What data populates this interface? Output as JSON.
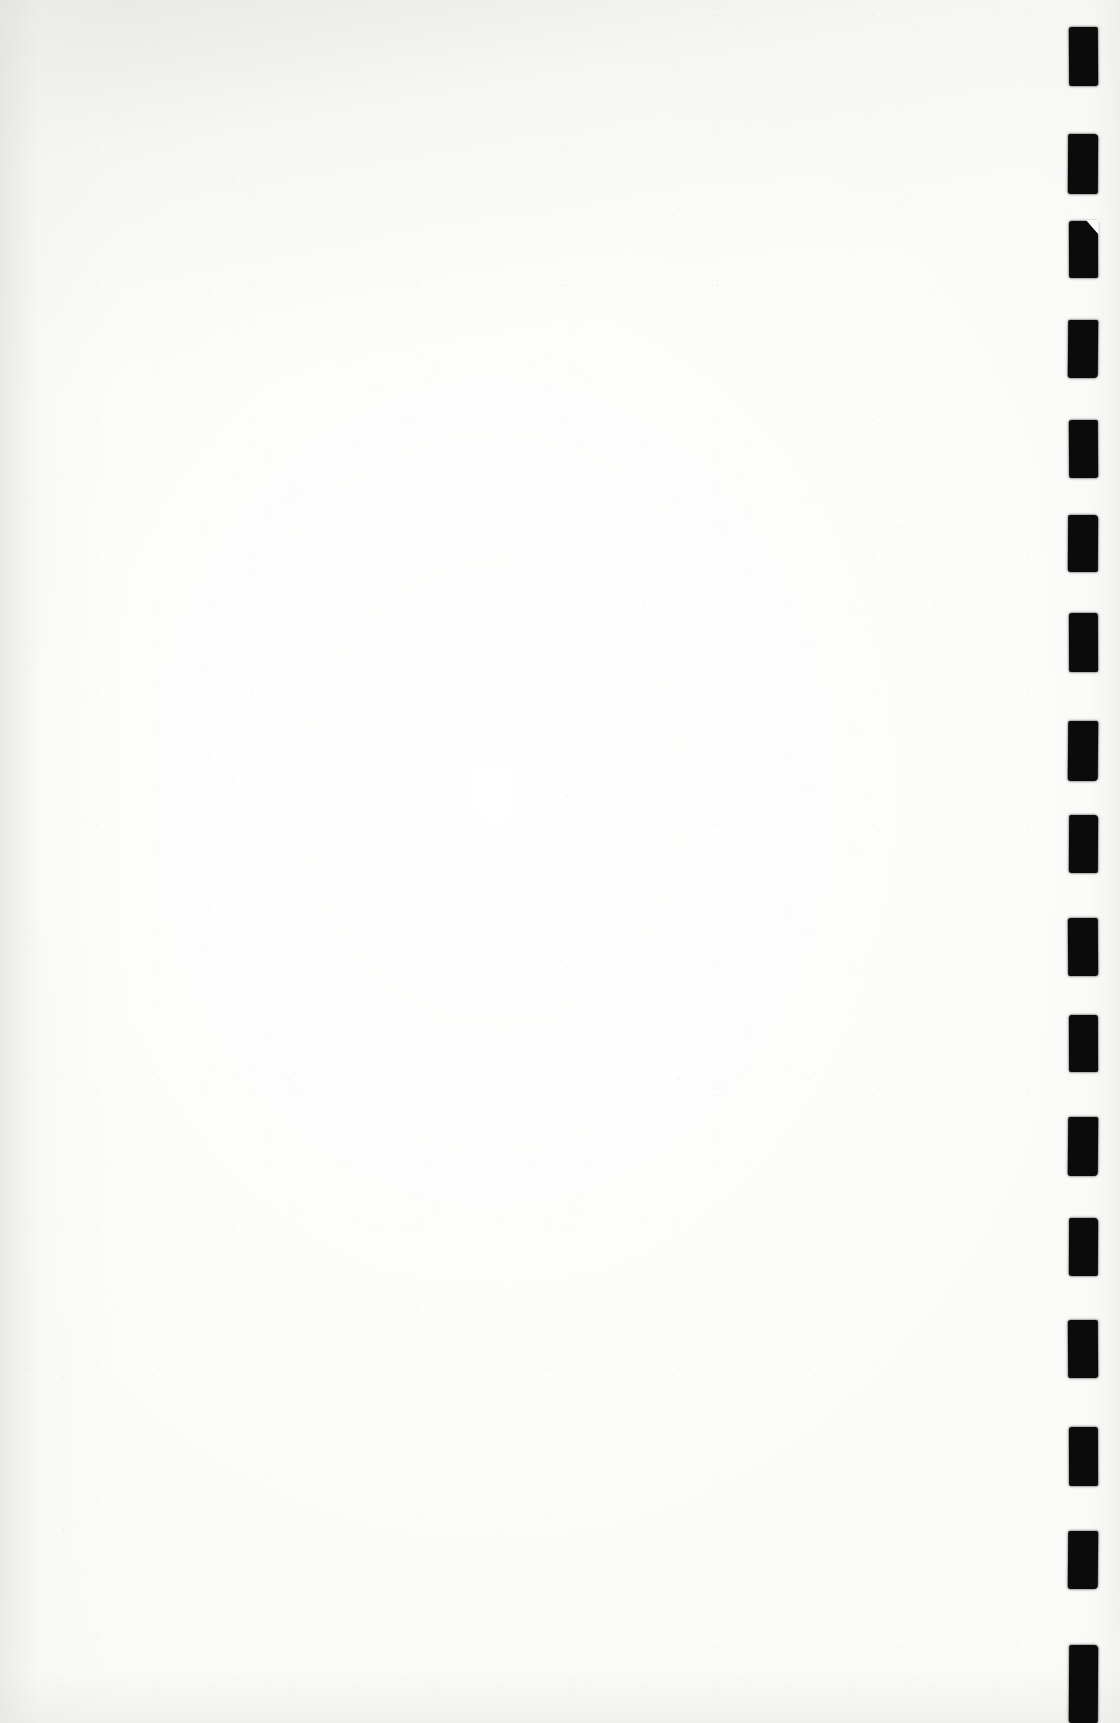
{
  "page": {
    "kind": "scanned-blank-page",
    "width": 1120,
    "height": 1723,
    "body_text": "",
    "paper_color": "#fbfbf9",
    "ink_color": "#0b0b0b",
    "edge_shadow_color": "#e4e4e0"
  },
  "mark_strip": {
    "label": "register-mark-column",
    "position": "right-margin",
    "count": 16,
    "mark_width": 30,
    "mark_height": 58,
    "pitch": 108,
    "left": 1068,
    "marks": [
      {
        "index": 1,
        "top": 27,
        "left": 1069,
        "width": 29,
        "height": 59,
        "notched": false,
        "jitter": "j1"
      },
      {
        "index": 2,
        "top": 134,
        "left": 1068,
        "width": 30,
        "height": 60,
        "notched": false,
        "jitter": "j2"
      },
      {
        "index": 3,
        "top": 221,
        "left": 1069,
        "width": 29,
        "height": 57,
        "notched": true,
        "jitter": "j3"
      },
      {
        "index": 4,
        "top": 320,
        "left": 1068,
        "width": 30,
        "height": 58,
        "notched": false,
        "jitter": "j4"
      },
      {
        "index": 5,
        "top": 420,
        "left": 1069,
        "width": 29,
        "height": 58,
        "notched": false,
        "jitter": "j1"
      },
      {
        "index": 6,
        "top": 515,
        "left": 1068,
        "width": 30,
        "height": 57,
        "notched": false,
        "jitter": "j2"
      },
      {
        "index": 7,
        "top": 613,
        "left": 1069,
        "width": 29,
        "height": 59,
        "notched": false,
        "jitter": "j3"
      },
      {
        "index": 8,
        "top": 721,
        "left": 1068,
        "width": 30,
        "height": 60,
        "notched": false,
        "jitter": "j4"
      },
      {
        "index": 9,
        "top": 815,
        "left": 1069,
        "width": 29,
        "height": 58,
        "notched": false,
        "jitter": "j2"
      },
      {
        "index": 10,
        "top": 918,
        "left": 1068,
        "width": 30,
        "height": 58,
        "notched": false,
        "jitter": "j1"
      },
      {
        "index": 11,
        "top": 1015,
        "left": 1069,
        "width": 29,
        "height": 57,
        "notched": false,
        "jitter": "j3"
      },
      {
        "index": 12,
        "top": 1117,
        "left": 1068,
        "width": 30,
        "height": 59,
        "notched": false,
        "jitter": "j4"
      },
      {
        "index": 13,
        "top": 1218,
        "left": 1069,
        "width": 29,
        "height": 58,
        "notched": false,
        "jitter": "j2"
      },
      {
        "index": 14,
        "top": 1320,
        "left": 1068,
        "width": 30,
        "height": 58,
        "notched": false,
        "jitter": "j1"
      },
      {
        "index": 15,
        "top": 1427,
        "left": 1069,
        "width": 29,
        "height": 59,
        "notched": false,
        "jitter": "j3"
      },
      {
        "index": 16,
        "top": 1531,
        "left": 1068,
        "width": 30,
        "height": 58,
        "notched": false,
        "jitter": "j4"
      },
      {
        "index": 17,
        "top": 1645,
        "left": 1069,
        "width": 29,
        "height": 78,
        "notched": false,
        "jitter": "j2"
      }
    ]
  }
}
